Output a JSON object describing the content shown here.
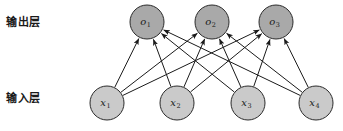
{
  "figure": {
    "title": "",
    "background_color": "#ffffff",
    "width": 343,
    "height": 131
  },
  "labels": {
    "output_layer": "输出层",
    "input_layer": "输入层"
  },
  "caption_sliver": "",
  "colors": {
    "output_node_fill": "#a9a9a9",
    "input_node_fill": "#cacaca",
    "node_stroke": "#2b2b2b",
    "edge_stroke": "#1a1a1a",
    "text": "#1a1a1a"
  },
  "chart_data": {
    "type": "diagram",
    "diagram_kind": "neural-network-fully-connected",
    "layers": [
      {
        "name": "输出层",
        "role": "output",
        "node_radius": 17,
        "y": 22,
        "nodes": [
          {
            "id": "o1",
            "base": "o",
            "sub": "1",
            "x": 147,
            "y": 22
          },
          {
            "id": "o2",
            "base": "o",
            "sub": "2",
            "x": 212,
            "y": 22
          },
          {
            "id": "o3",
            "base": "o",
            "sub": "3",
            "x": 276,
            "y": 22
          }
        ]
      },
      {
        "name": "输入层",
        "role": "input",
        "node_radius": 17,
        "y": 103,
        "nodes": [
          {
            "id": "x1",
            "base": "x",
            "sub": "1",
            "x": 107,
            "y": 103
          },
          {
            "id": "x2",
            "base": "x",
            "sub": "2",
            "x": 177,
            "y": 103
          },
          {
            "id": "x3",
            "base": "x",
            "sub": "3",
            "x": 248,
            "y": 103
          },
          {
            "id": "x4",
            "base": "x",
            "sub": "4",
            "x": 316,
            "y": 103
          }
        ]
      }
    ],
    "edges": [
      {
        "from": "x1",
        "to": "o1",
        "directed": true
      },
      {
        "from": "x1",
        "to": "o2",
        "directed": true
      },
      {
        "from": "x1",
        "to": "o3",
        "directed": true
      },
      {
        "from": "x2",
        "to": "o1",
        "directed": true
      },
      {
        "from": "x2",
        "to": "o2",
        "directed": true
      },
      {
        "from": "x2",
        "to": "o3",
        "directed": true
      },
      {
        "from": "x3",
        "to": "o1",
        "directed": true
      },
      {
        "from": "x3",
        "to": "o2",
        "directed": true
      },
      {
        "from": "x3",
        "to": "o3",
        "directed": true
      },
      {
        "from": "x4",
        "to": "o1",
        "directed": true
      },
      {
        "from": "x4",
        "to": "o2",
        "directed": true
      },
      {
        "from": "x4",
        "to": "o3",
        "directed": true
      }
    ],
    "edge_count": 12,
    "arrow_direction": "input-to-output"
  }
}
